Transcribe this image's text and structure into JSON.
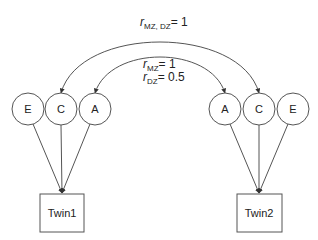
{
  "diagram": {
    "colors": {
      "stroke": "#555555",
      "text": "#222222",
      "background": "#ffffff"
    },
    "twin1": {
      "label": "Twin1",
      "factors": [
        {
          "id": "E1",
          "label": "E",
          "cx": 28,
          "cy": 109
        },
        {
          "id": "C1",
          "label": "C",
          "cx": 61,
          "cy": 109
        },
        {
          "id": "A1",
          "label": "A",
          "cx": 95,
          "cy": 109
        }
      ]
    },
    "twin2": {
      "label": "Twin2",
      "factors": [
        {
          "id": "A2",
          "label": "A",
          "cx": 225,
          "cy": 109
        },
        {
          "id": "C2",
          "label": "C",
          "cx": 259,
          "cy": 109
        },
        {
          "id": "E2",
          "label": "E",
          "cx": 293,
          "cy": 109
        }
      ]
    },
    "correlations": {
      "c_outer": {
        "r": "r",
        "sub": "MZ, DZ",
        "eq": "= 1",
        "connects": [
          "C1",
          "C2"
        ]
      },
      "a_inner_mz": {
        "r": "r",
        "sub": "MZ",
        "eq": "= 1",
        "connects": [
          "A1",
          "A2"
        ]
      },
      "a_inner_dz": {
        "r": "r",
        "sub": "DZ",
        "eq": "= 0.5",
        "connects": [
          "A1",
          "A2"
        ]
      }
    }
  }
}
